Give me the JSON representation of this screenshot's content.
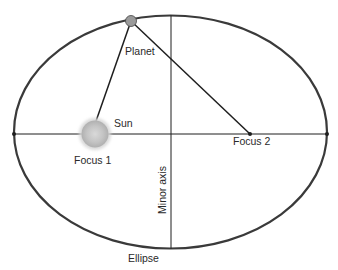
{
  "diagram": {
    "labels": {
      "planet": "Planet",
      "sun": "Sun",
      "focus1": "Focus 1",
      "focus2": "Focus 2",
      "minor_axis": "Minor axis",
      "ellipse": "Ellipse"
    },
    "colors": {
      "ellipse_stroke": "#3a3a3a",
      "line": "#1e1e1e",
      "planet_fill": "#9a9a9a",
      "sun_fill": "#c8c8c8",
      "text": "#2a2a2a"
    }
  }
}
